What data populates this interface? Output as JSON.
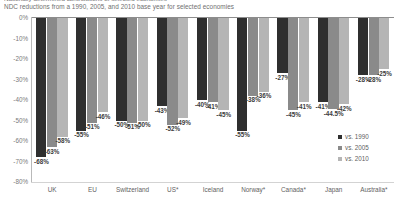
{
  "title_clipped": "Nationally determined contributions of selected economies",
  "subtitle": "NDC reductions from a 1990, 2005, and 2010 base year for selected economies",
  "legend": {
    "items": [
      {
        "label": "vs. 1990",
        "color": "#2f2f2f"
      },
      {
        "label": "vs. 2005",
        "color": "#8a8a8a"
      },
      {
        "label": "vs. 2010",
        "color": "#b5b5b5"
      }
    ]
  },
  "yaxis": {
    "ticks": [
      "0%",
      "-10%",
      "-20%",
      "-30%",
      "-40%",
      "-50%",
      "-60%",
      "-70%",
      "-80%"
    ]
  },
  "chart_data": {
    "type": "bar",
    "title": "",
    "subtitle": "NDC reductions from a 1990, 2005, and 2010 base year for selected economies",
    "xlabel": "",
    "ylabel": "",
    "ylim": [
      -80,
      0
    ],
    "ytick_values": [
      0,
      -10,
      -20,
      -30,
      -40,
      -50,
      -60,
      -70,
      -80
    ],
    "grid": false,
    "legend_position": "bottom-right",
    "categories": [
      "UK",
      "EU",
      "Switzerland",
      "US*",
      "Iceland",
      "Norway*",
      "Canada*",
      "Japan",
      "Australia*"
    ],
    "series": [
      {
        "name": "vs. 1990",
        "color": "#2f2f2f",
        "values": [
          -68,
          -55,
          -50,
          -43,
          -40,
          -55,
          -27,
          -41,
          -28
        ],
        "labels": [
          "-68%",
          "-55%",
          "-50%",
          "-43%",
          "-40%",
          "-55%",
          "-27%",
          "-41%",
          "-28%"
        ]
      },
      {
        "name": "vs. 2005",
        "color": "#8a8a8a",
        "values": [
          -63,
          -51,
          -51,
          -52,
          -41,
          -38,
          -45,
          -44.5,
          -28
        ],
        "labels": [
          "-63%",
          "-51%",
          "-51%",
          "-52%",
          "-41%",
          "-38%",
          "-45%",
          "-44.5%",
          "-28%"
        ]
      },
      {
        "name": "vs. 2010",
        "color": "#b5b5b5",
        "values": [
          -58,
          -46,
          -50,
          -49,
          -45,
          -36,
          -41,
          -42,
          -25
        ],
        "labels": [
          "-58%",
          "-46%",
          "-50%",
          "-49%",
          "-45%",
          "-36%",
          "-41%",
          "-42%",
          "-25%"
        ]
      }
    ]
  }
}
